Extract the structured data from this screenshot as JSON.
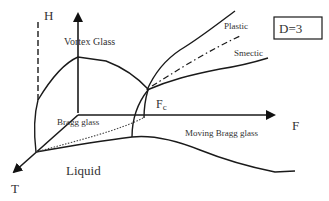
{
  "diagram": {
    "title_box": "D=3",
    "axes": {
      "vertical": "H",
      "horizontal": "F",
      "depth": "T"
    },
    "regions": {
      "vortex_glass": "Vortex Glass",
      "bragg_glass": "Bragg glass",
      "moving_bragg_glass": "Moving Bragg glass",
      "liquid": "Liquid",
      "plastic": "Plastic",
      "smectic": "Smectic"
    },
    "critical_point": {
      "main": "F",
      "subscript": "c"
    },
    "line_styles": {
      "field_boundary": "dashed",
      "plastic_boundary": "solid",
      "smectic_boundary": "dash-dot",
      "bragg_liquid_boundary": "dotted"
    }
  }
}
